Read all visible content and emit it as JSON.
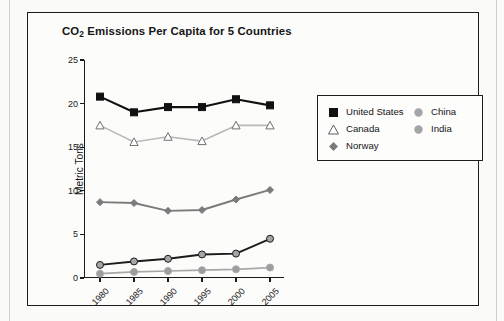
{
  "figure": {
    "title_prefix": "CO",
    "title_sub": "2",
    "title_suffix": " Emissions Per Capita for 5 Countries"
  },
  "chart_data": {
    "type": "line",
    "title": "CO2 Emissions Per Capita for 5 Countries",
    "xlabel": "",
    "ylabel": "Metric Tons",
    "x": [
      "1980",
      "1985",
      "1990",
      "1995",
      "2000",
      "2005"
    ],
    "xtick_labels": [
      "1980",
      "1985",
      "1990",
      "1995",
      "2000",
      "2005"
    ],
    "ytick_labels": [
      "0",
      "5",
      "10",
      "15",
      "20",
      "25"
    ],
    "ylim": [
      0,
      25
    ],
    "ytick_step": 5,
    "grid": false,
    "legend_position": "right",
    "series": [
      {
        "name": "United States",
        "values": [
          20.8,
          19.0,
          19.6,
          19.6,
          20.5,
          19.8
        ],
        "color": "#111111",
        "marker": "square",
        "marker_fill": "#111111",
        "line_width": 2.1,
        "marker_size": 7
      },
      {
        "name": "Canada",
        "values": [
          17.5,
          15.6,
          16.2,
          15.7,
          17.5,
          17.5
        ],
        "color": "#b9b9b9",
        "marker": "triangle",
        "marker_fill": "#ffffff",
        "line_width": 1.6,
        "marker_size": 7
      },
      {
        "name": "Norway",
        "values": [
          8.7,
          8.6,
          7.7,
          7.8,
          9.0,
          10.1
        ],
        "color": "#7b7b7b",
        "marker": "diamond",
        "marker_fill": "#7b7b7b",
        "line_width": 1.9,
        "marker_size": 7
      },
      {
        "name": "China",
        "values": [
          1.5,
          1.9,
          2.2,
          2.7,
          2.8,
          4.5
        ],
        "color": "#1b1b1b",
        "marker": "circle",
        "marker_fill": "#a5a5a5",
        "line_width": 1.9,
        "marker_size": 7
      },
      {
        "name": "India",
        "values": [
          0.5,
          0.7,
          0.8,
          0.9,
          1.0,
          1.2
        ],
        "color": "#a8a8a8",
        "marker": "circle",
        "marker_fill": "#9d9d9d",
        "line_width": 1.7,
        "marker_size": 7
      }
    ]
  },
  "legend": {
    "left_column": [
      {
        "label": "United States",
        "marker": "square"
      },
      {
        "label": "Canada",
        "marker": "triangle"
      },
      {
        "label": "Norway",
        "marker": "diamond"
      }
    ],
    "right_column": [
      {
        "label": "China",
        "marker": "circle"
      },
      {
        "label": "India",
        "marker": "circle"
      }
    ]
  }
}
